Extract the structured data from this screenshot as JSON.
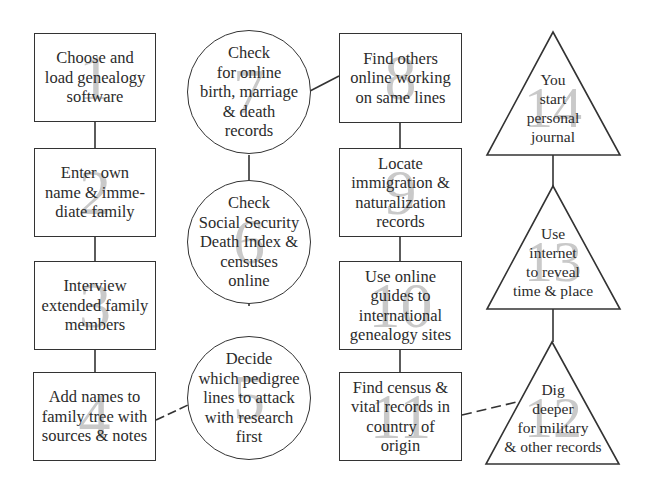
{
  "diagram": {
    "type": "flowchart",
    "colors": {
      "stroke": "#333333",
      "number": "#c9c9c9",
      "text": "#2b2b2b",
      "background": "#ffffff"
    },
    "nodes": [
      {
        "id": 1,
        "shape": "rectangle",
        "number": "1",
        "label": "Choose and\nload genealogy\nsoftware"
      },
      {
        "id": 2,
        "shape": "rectangle",
        "number": "2",
        "label": "Enter own\nname & imme-\ndiate family"
      },
      {
        "id": 3,
        "shape": "rectangle",
        "number": "3",
        "label": "Interview\nextended family\nmembers"
      },
      {
        "id": 4,
        "shape": "rectangle",
        "number": "4",
        "label": "Add names to\nfamily tree with\nsources & notes"
      },
      {
        "id": 5,
        "shape": "circle",
        "number": "5",
        "label": "Decide\nwhich pedigree\nlines to attack\nwith research\nfirst"
      },
      {
        "id": 6,
        "shape": "circle",
        "number": "6",
        "label": "Check\nSocial Security\nDeath Index &\ncensuses\nonline"
      },
      {
        "id": 7,
        "shape": "circle",
        "number": "7",
        "label": "Check\nfor online\nbirth, marriage\n& death\nrecords"
      },
      {
        "id": 8,
        "shape": "rectangle",
        "number": "8",
        "label": "Find others\nonline working\non same lines"
      },
      {
        "id": 9,
        "shape": "rectangle",
        "number": "9",
        "label": "Locate\nimmigration &\nnaturalization\nrecords"
      },
      {
        "id": 10,
        "shape": "rectangle",
        "number": "10",
        "label": "Use online\nguides to\ninternational\ngenealogy sites"
      },
      {
        "id": 11,
        "shape": "rectangle",
        "number": "11",
        "label": "Find census &\nvital records in\ncountry of\norigin"
      },
      {
        "id": 12,
        "shape": "triangle",
        "number": "12",
        "label": "Dig\ndeeper\nfor military\n& other records"
      },
      {
        "id": 13,
        "shape": "triangle",
        "number": "13",
        "label": "Use\ninternet\nto reveal\ntime & place"
      },
      {
        "id": 14,
        "shape": "triangle",
        "number": "14",
        "label": "You\nstart\npersonal\njournal"
      }
    ],
    "edges": [
      {
        "from": 1,
        "to": 2,
        "style": "solid"
      },
      {
        "from": 2,
        "to": 3,
        "style": "solid"
      },
      {
        "from": 3,
        "to": 4,
        "style": "solid"
      },
      {
        "from": 4,
        "to": 5,
        "style": "dashed"
      },
      {
        "from": 5,
        "to": 6,
        "style": "solid"
      },
      {
        "from": 6,
        "to": 7,
        "style": "solid"
      },
      {
        "from": 7,
        "to": 8,
        "style": "solid"
      },
      {
        "from": 8,
        "to": 9,
        "style": "solid"
      },
      {
        "from": 9,
        "to": 10,
        "style": "solid"
      },
      {
        "from": 10,
        "to": 11,
        "style": "solid"
      },
      {
        "from": 11,
        "to": 12,
        "style": "dashed"
      },
      {
        "from": 12,
        "to": 13,
        "style": "solid"
      },
      {
        "from": 13,
        "to": 14,
        "style": "solid"
      }
    ]
  }
}
